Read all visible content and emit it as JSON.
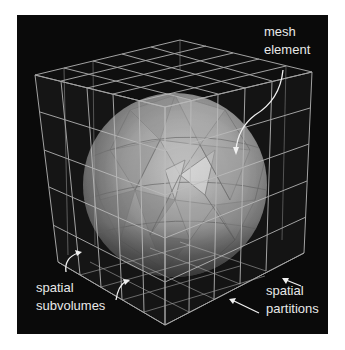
{
  "figure": {
    "background": "#0a0a0a",
    "panel": {
      "x": 17,
      "y": 15,
      "width": 311,
      "height": 319
    },
    "sphere": {
      "cx": 175,
      "cy": 185,
      "r": 92,
      "fill": "#9a9a9a"
    },
    "grid_color": "#bdbdbd",
    "annotation_color": "#f0f0f0"
  },
  "labels": {
    "mesh_element_line1": "mesh",
    "mesh_element_line2": "element",
    "spatial_subvolumes_line1": "spatial",
    "spatial_subvolumes_line2": "subvolumes",
    "spatial_partitions_line1": "spatial",
    "spatial_partitions_line2": "partitions"
  }
}
